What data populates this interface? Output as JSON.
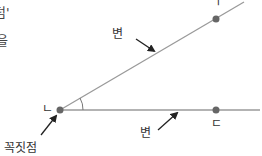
{
  "text_fragments": {
    "top_left_1": "덤'",
    "top_left_2": "을"
  },
  "diagram": {
    "title": "",
    "vertex_label": "ㄴ",
    "upper_point_label": "ㄱ",
    "lower_point_label": "ㄷ",
    "side_label_upper": "변",
    "side_label_lower": "변",
    "vertex_caption": "꼭짓점",
    "colors": {
      "line": "#999999",
      "point": "#666666",
      "arrow": "#222222",
      "text": "#333333"
    }
  }
}
